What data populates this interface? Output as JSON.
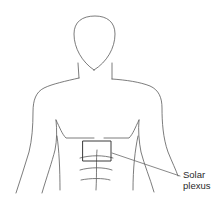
{
  "diagram": {
    "highlight_region": "solar plexus box",
    "stroke_color": "#555555",
    "callout": {
      "line1": "Solar",
      "line2": "plexus"
    }
  }
}
